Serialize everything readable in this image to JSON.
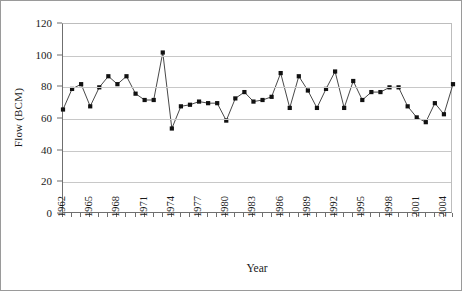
{
  "chart_data": {
    "type": "line",
    "title": "",
    "xlabel": "Year",
    "ylabel": "Flow (BCM)",
    "ylim": [
      0,
      120
    ],
    "ytick_values": [
      0,
      20,
      40,
      60,
      80,
      100,
      120
    ],
    "ytick_labels": [
      "0",
      "20",
      "40",
      "60",
      "80",
      "100",
      "120"
    ],
    "grid": "horizontal",
    "legend": "none",
    "marker": "filled-square",
    "xlim": [
      1962,
      2005
    ],
    "xtick_labels": [
      "1962",
      "1965",
      "1968",
      "1971",
      "1974",
      "1977",
      "1980",
      "1983",
      "1986",
      "1989",
      "1992",
      "1995",
      "1998",
      "2001",
      "2004"
    ],
    "xtick_values": [
      1962,
      1965,
      1968,
      1971,
      1974,
      1977,
      1980,
      1983,
      1986,
      1989,
      1992,
      1995,
      1998,
      2001,
      2004
    ],
    "x": [
      1962,
      1963,
      1964,
      1965,
      1966,
      1967,
      1968,
      1969,
      1970,
      1971,
      1972,
      1973,
      1974,
      1975,
      1976,
      1977,
      1978,
      1979,
      1980,
      1981,
      1982,
      1983,
      1984,
      1985,
      1986,
      1987,
      1988,
      1989,
      1990,
      1991,
      1992,
      1993,
      1994,
      1995,
      1996,
      1997,
      1998,
      1999,
      2000,
      2001,
      2002,
      2003,
      2004,
      2005
    ],
    "values": [
      66,
      79,
      82,
      68,
      80,
      87,
      82,
      87,
      76,
      72,
      72,
      102,
      54,
      68,
      69,
      71,
      70,
      70,
      59,
      73,
      77,
      71,
      72,
      74,
      89,
      67,
      87,
      78,
      67,
      79,
      90,
      67,
      84,
      72,
      77,
      77,
      80,
      80,
      68,
      61,
      58,
      70,
      63,
      82
    ],
    "series": [
      {
        "name": "Flow",
        "values": [
          66,
          79,
          82,
          68,
          80,
          87,
          82,
          87,
          76,
          72,
          72,
          102,
          54,
          68,
          69,
          71,
          70,
          70,
          59,
          73,
          77,
          71,
          72,
          74,
          89,
          67,
          87,
          78,
          67,
          79,
          90,
          67,
          84,
          72,
          77,
          77,
          80,
          80,
          68,
          61,
          58,
          70,
          63,
          82
        ]
      }
    ],
    "colors": {
      "marker": "#111111",
      "line": "#333333",
      "grid": "#c8c8c8",
      "axis": "#6f6f6f",
      "text": "#1a1a1a",
      "background": "#ffffff",
      "border": "#9a9a9a"
    }
  }
}
